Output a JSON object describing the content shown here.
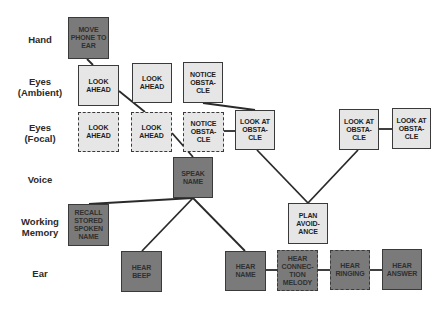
{
  "rows": [
    {
      "id": "hand",
      "label": "Hand",
      "y": 39
    },
    {
      "id": "eyes-ambient",
      "label": "Eyes\n(Ambient)",
      "y": 87
    },
    {
      "id": "eyes-focal",
      "label": "Eyes\n(Focal)",
      "y": 133
    },
    {
      "id": "voice",
      "label": "Voice",
      "y": 179
    },
    {
      "id": "working-memory",
      "label": "Working\nMemory",
      "y": 227
    },
    {
      "id": "ear",
      "label": "Ear",
      "y": 273
    }
  ],
  "boxes": [
    {
      "id": "move-phone-to-ear",
      "label": "MOVE\nPHONE TO\nEAR",
      "style": "dark",
      "border": "solid",
      "x": 68,
      "y": 17,
      "w": 41,
      "h": 42
    },
    {
      "id": "look-ahead-ambient-1",
      "label": "LOOK\nAHEAD",
      "style": "light",
      "border": "solid",
      "x": 78,
      "y": 65,
      "w": 41,
      "h": 41
    },
    {
      "id": "look-ahead-ambient-2",
      "label": "LOOK\nAHEAD",
      "style": "light",
      "border": "solid",
      "x": 132,
      "y": 63,
      "w": 40,
      "h": 40
    },
    {
      "id": "notice-obstacle-ambient",
      "label": "NOTICE\nOBSTA-\nCLE",
      "style": "light",
      "border": "solid",
      "x": 183,
      "y": 62,
      "w": 40,
      "h": 41
    },
    {
      "id": "look-ahead-focal-1",
      "label": "LOOK\nAHEAD",
      "style": "light",
      "border": "dashed",
      "x": 78,
      "y": 112,
      "w": 41,
      "h": 40
    },
    {
      "id": "look-ahead-focal-2",
      "label": "LOOK\nAHEAD",
      "style": "light",
      "border": "dashed",
      "x": 131,
      "y": 112,
      "w": 41,
      "h": 40
    },
    {
      "id": "notice-obstacle-focal",
      "label": "NOTICE\nOBSTA-\nCLE",
      "style": "light",
      "border": "dashed",
      "x": 183,
      "y": 112,
      "w": 41,
      "h": 40
    },
    {
      "id": "look-at-obstacle-1",
      "label": "LOOK AT\nOBSTA-\nCLE",
      "style": "light",
      "border": "solid",
      "x": 235,
      "y": 110,
      "w": 40,
      "h": 40
    },
    {
      "id": "look-at-obstacle-2",
      "label": "LOOK AT\nOBSTA-\nCLE",
      "style": "light",
      "border": "solid",
      "x": 339,
      "y": 109,
      "w": 40,
      "h": 41
    },
    {
      "id": "look-at-obstacle-3",
      "label": "LOOK AT\nOBSTA-\nCLE",
      "style": "light",
      "border": "solid",
      "x": 392,
      "y": 108,
      "w": 39,
      "h": 41
    },
    {
      "id": "speak-name",
      "label": "SPEAK\nNAME",
      "style": "dark",
      "border": "solid",
      "x": 173,
      "y": 157,
      "w": 40,
      "h": 41
    },
    {
      "id": "recall-stored-spoken-name",
      "label": "RECALL\nSTORED\nSPOKEN\nNAME",
      "style": "dark",
      "border": "solid",
      "x": 68,
      "y": 204,
      "w": 41,
      "h": 42
    },
    {
      "id": "plan-avoidance",
      "label": "PLAN\nAVOID-\nANCE",
      "style": "light",
      "border": "solid",
      "x": 288,
      "y": 203,
      "w": 40,
      "h": 41
    },
    {
      "id": "hear-beep",
      "label": "HEAR\nBEEP",
      "style": "dark",
      "border": "solid",
      "x": 121,
      "y": 251,
      "w": 41,
      "h": 41
    },
    {
      "id": "hear-name",
      "label": "HEAR\nNAME",
      "style": "dark",
      "border": "solid",
      "x": 225,
      "y": 251,
      "w": 41,
      "h": 40
    },
    {
      "id": "hear-connection-melody",
      "label": "HEAR\nCONNEC-\nTION\nMELODY",
      "style": "dark",
      "border": "dashed",
      "x": 277,
      "y": 250,
      "w": 41,
      "h": 41
    },
    {
      "id": "hear-ringing",
      "label": "HEAR\nRINGING",
      "style": "dark",
      "border": "dashed",
      "x": 330,
      "y": 250,
      "w": 40,
      "h": 40
    },
    {
      "id": "hear-answer",
      "label": "HEAR\nANSWER",
      "style": "dark",
      "border": "solid",
      "x": 382,
      "y": 249,
      "w": 40,
      "h": 41
    }
  ],
  "connections": [
    {
      "from": "move-phone-to-ear",
      "to": "look-ahead-ambient-1",
      "x1": 87,
      "y1": 59,
      "x2": 93,
      "y2": 65
    },
    {
      "from": "look-ahead-ambient-1",
      "to": "look-ahead-focal-2",
      "x1": 119,
      "y1": 91,
      "x2": 145,
      "y2": 112
    },
    {
      "from": "notice-obstacle-ambient",
      "to": "look-at-obstacle-1",
      "x1": 203,
      "y1": 103,
      "x2": 255,
      "y2": 110
    },
    {
      "from": "look-ahead-focal-2",
      "to": "speak-name",
      "x1": 172,
      "y1": 133,
      "x2": 193,
      "y2": 157
    },
    {
      "from": "notice-obstacle-focal",
      "to": "look-at-obstacle-1",
      "x1": 224,
      "y1": 131,
      "x2": 235,
      "y2": 131
    },
    {
      "from": "look-at-obstacle-2",
      "to": "look-at-obstacle-3",
      "x1": 379,
      "y1": 129,
      "x2": 392,
      "y2": 129
    },
    {
      "from": "look-at-obstacle-1",
      "to": "plan-avoidance",
      "x1": 257,
      "y1": 150,
      "x2": 308,
      "y2": 203
    },
    {
      "from": "look-at-obstacle-2",
      "to": "plan-avoidance",
      "x1": 358,
      "y1": 150,
      "x2": 308,
      "y2": 203
    },
    {
      "from": "speak-name",
      "to": "recall-stored-spoken-name",
      "x1": 193,
      "y1": 198,
      "x2": 89,
      "y2": 204
    },
    {
      "from": "speak-name",
      "to": "hear-beep",
      "x1": 193,
      "y1": 198,
      "x2": 142,
      "y2": 251
    },
    {
      "from": "speak-name",
      "to": "hear-name",
      "x1": 193,
      "y1": 198,
      "x2": 245,
      "y2": 251
    },
    {
      "from": "hear-name",
      "to": "hear-connection-melody",
      "x1": 266,
      "y1": 270,
      "x2": 277,
      "y2": 270
    },
    {
      "from": "hear-connection-melody",
      "to": "hear-ringing",
      "x1": 318,
      "y1": 270,
      "x2": 330,
      "y2": 270
    },
    {
      "from": "hear-ringing",
      "to": "hear-answer",
      "x1": 370,
      "y1": 270,
      "x2": 382,
      "y2": 270
    }
  ],
  "colors": {
    "light_box": "#e6e6e6",
    "dark_box": "#7a7a7a",
    "line": "#2a2a2a"
  }
}
